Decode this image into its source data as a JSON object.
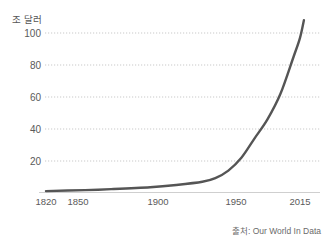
{
  "chart_data": {
    "type": "line",
    "title": "",
    "subtitle": "",
    "xlabel": "",
    "ylabel": "조 달러",
    "ylabel_note": "trillion dollars",
    "source": "출처: Our World In Data",
    "grid": true,
    "grid_axis": "y",
    "legend": "none",
    "xlim": [
      1820,
      2020
    ],
    "ylim": [
      0,
      110
    ],
    "yticks": [
      20,
      40,
      60,
      80,
      100
    ],
    "ytick_labels": [
      "20",
      "40",
      "60",
      "80",
      "100"
    ],
    "xticks": [
      1820,
      1850,
      1900,
      1950,
      2015
    ],
    "xtick_labels": [
      "1820",
      "1850",
      "1900",
      "1950",
      "2015"
    ],
    "line_color": "#555555",
    "line_width": 2.4,
    "series": [
      {
        "name": "World GDP",
        "x": [
          1820,
          1850,
          1870,
          1900,
          1920,
          1940,
          1950,
          1960,
          1970,
          1980,
          1990,
          2000,
          2010,
          2015,
          2018
        ],
        "values": [
          1.2,
          1.8,
          2.4,
          3.6,
          5.0,
          7.0,
          9.3,
          14.0,
          22.0,
          34.0,
          46.0,
          62.0,
          85.0,
          97.0,
          108.0
        ]
      }
    ]
  },
  "chart": {
    "title_text": "",
    "y_unit": "조 달러",
    "y_ticks": [
      "100",
      "80",
      "60",
      "40",
      "20"
    ],
    "x_ticks": [
      "1820",
      "1850",
      "1900",
      "1950",
      "2015"
    ],
    "source": "출처: Our World In Data"
  }
}
